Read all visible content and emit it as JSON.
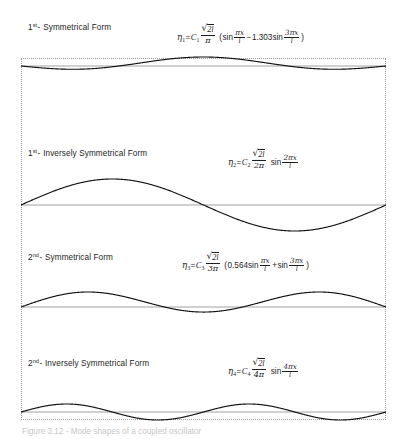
{
  "figure": {
    "caption": "Figure 3.12 - Mode shapes of a coupled oscillator",
    "frame": {
      "x": 21,
      "y": 58,
      "width": 365,
      "height": 362,
      "style": "dotted",
      "color": "#9a9a9a"
    },
    "baseline_color": "#8c8c8c",
    "curve_color": "#111111"
  },
  "rows": [
    {
      "label_prefix": "1",
      "label_ordinal": "st",
      "label_dash": "-",
      "label_text": "Symmetrical Form",
      "formula_plain": "η₁ = C₁ √(2l)/π (sin πx/l − 1.303sin 3πx/l)",
      "eta": "η",
      "eta_sub": "1",
      "coeff": "C",
      "coeff_sub": "1",
      "radicand": "2l",
      "denominator": "π",
      "term1_coeff": "",
      "term1_fn": "sin",
      "term1_num": "πx",
      "term1_den": "l",
      "operator": "−",
      "term2_coeff": "1.303",
      "term2_fn": "sin",
      "term2_num": "3πx",
      "term2_den": "l",
      "paren": true
    },
    {
      "label_prefix": "1",
      "label_ordinal": "st",
      "label_dash": "-",
      "label_text": "Inversely Symmetrical Form",
      "formula_plain": "η₂ = C₂ √(2l)/(2π) sin 2πx/l",
      "eta": "η",
      "eta_sub": "2",
      "coeff": "C",
      "coeff_sub": "2",
      "radicand": "2l",
      "denominator": "2π",
      "term1_coeff": "",
      "term1_fn": "sin",
      "term1_num": "2πx",
      "term1_den": "l",
      "operator": "",
      "term2_coeff": "",
      "term2_fn": "",
      "term2_num": "",
      "term2_den": "",
      "paren": false
    },
    {
      "label_prefix": "2",
      "label_ordinal": "nd",
      "label_dash": "-",
      "label_text": "Symmetrical Form",
      "formula_plain": "η₃ = C₃ √(2l)/(3π) (0.564sin πx/l + sin 3πx/l)",
      "eta": "η",
      "eta_sub": "3",
      "coeff": "C",
      "coeff_sub": "3",
      "radicand": "2l",
      "denominator": "3π",
      "term1_coeff": "0.564",
      "term1_fn": "sin",
      "term1_num": "πx",
      "term1_den": "l",
      "operator": "+",
      "term2_coeff": "",
      "term2_fn": "sin",
      "term2_num": "3πx",
      "term2_den": "l",
      "paren": true
    },
    {
      "label_prefix": "2",
      "label_ordinal": "nd",
      "label_dash": "-",
      "label_text": "Inversely Symmetrical Form",
      "formula_plain": "η₄ = C₄ √(2l)/(4π) sin 4πx/l",
      "eta": "η",
      "eta_sub": "4",
      "coeff": "C",
      "coeff_sub": "4",
      "radicand": "2l",
      "denominator": "4π",
      "term1_coeff": "",
      "term1_fn": "sin",
      "term1_num": "4πx",
      "term1_den": "l",
      "operator": "",
      "term2_coeff": "",
      "term2_fn": "",
      "term2_num": "",
      "term2_den": "",
      "paren": false
    }
  ],
  "chart_data": {
    "type": "line",
    "title": "Mode shapes of a coupled oscillator",
    "xlabel": "x / l",
    "ylabel": "η",
    "xlim": [
      0,
      1
    ],
    "grid": false,
    "legend": "none",
    "series": [
      {
        "name": "η₁ — 1st Symmetrical Form",
        "expression": "sin(pi*x) - 1.303*sin(3*pi*x)",
        "terms": [
          {
            "amplitude": 1.0,
            "harmonic": 1
          },
          {
            "amplitude": -1.303,
            "harmonic": 3
          }
        ],
        "baseline_y": 66,
        "amplitude_px": 9,
        "scale": 0.3
      },
      {
        "name": "η₂ — 1st Inversely Symmetrical Form",
        "expression": "sin(2*pi*x)",
        "terms": [
          {
            "amplitude": 1.0,
            "harmonic": 2
          }
        ],
        "baseline_y": 205,
        "amplitude_px": 26,
        "scale": 1.0
      },
      {
        "name": "η₃ — 2nd Symmetrical Form",
        "expression": "0.564*sin(pi*x) + sin(3*pi*x)",
        "terms": [
          {
            "amplitude": 0.564,
            "harmonic": 1
          },
          {
            "amplitude": 1.0,
            "harmonic": 3
          }
        ],
        "baseline_y": 307,
        "amplitude_px": 14,
        "scale": 0.62
      },
      {
        "name": "η₄ — 2nd Inversely Symmetrical Form",
        "expression": "sin(4*pi*x)",
        "terms": [
          {
            "amplitude": 1.0,
            "harmonic": 4
          }
        ],
        "baseline_y": 412,
        "amplitude_px": 8,
        "scale": 0.32
      }
    ]
  }
}
